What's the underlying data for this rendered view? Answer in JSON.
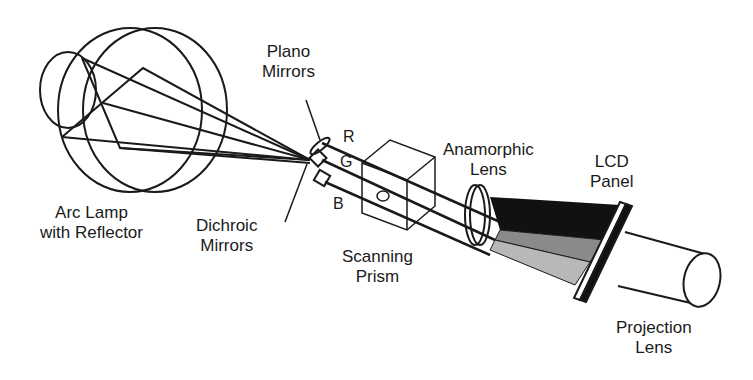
{
  "diagram": {
    "type": "optical-system-schematic",
    "labels": {
      "arc_lamp": [
        "Arc Lamp",
        "with Reflector"
      ],
      "plano_mirrors": [
        "Plano",
        "Mirrors"
      ],
      "dichroic_mirrors": [
        "Dichroic",
        "Mirrors"
      ],
      "scanning_prism": [
        "Scanning",
        "Prism"
      ],
      "anamorphic_lens": [
        "Anamorphic",
        "Lens"
      ],
      "lcd_panel": [
        "LCD",
        "Panel"
      ],
      "projection_lens": [
        "Projection",
        "Lens"
      ]
    },
    "beams": {
      "red": "R",
      "green": "G",
      "blue": "B"
    },
    "colors": {
      "line": "#1a1a1a",
      "dark_fill": "#111111",
      "mid_fill": "#8a8a8a",
      "light_fill": "#b8b8b8"
    }
  }
}
